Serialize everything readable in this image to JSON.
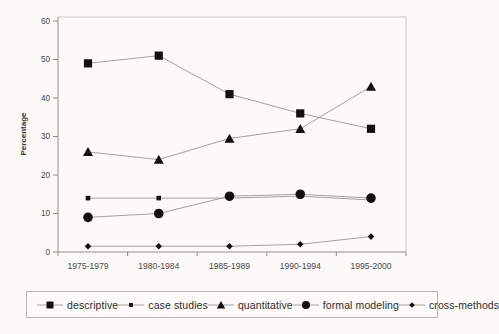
{
  "chart_data": {
    "type": "line",
    "title": "",
    "xlabel": "",
    "ylabel": "Percentage",
    "ylim": [
      0,
      60
    ],
    "yticks": [
      0,
      10,
      20,
      30,
      40,
      50,
      60
    ],
    "grid": false,
    "legend_position": "bottom",
    "categories": [
      "1975-1979",
      "1980-1984",
      "1985-1989",
      "1990-1994",
      "1995-2000"
    ],
    "series": [
      {
        "name": "descriptive",
        "marker": "square-large",
        "values": [
          49,
          51,
          41,
          36,
          32
        ]
      },
      {
        "name": "case studies",
        "marker": "square-small",
        "values": [
          14,
          14,
          14,
          14.5,
          13.5
        ]
      },
      {
        "name": "quantitative",
        "marker": "triangle",
        "values": [
          26,
          24,
          29.5,
          32,
          43
        ]
      },
      {
        "name": "formal modeling",
        "marker": "circle",
        "values": [
          9,
          10,
          14.5,
          15,
          14
        ]
      },
      {
        "name": "cross-methods",
        "marker": "diamond",
        "values": [
          1.5,
          1.5,
          1.5,
          2,
          4
        ]
      }
    ],
    "colors": {
      "marker": "#121110",
      "line": "#9a9792",
      "axis": "#918e89",
      "frame": "#c9c6c1",
      "tick_text": "#4a4845",
      "label_text": "#3a3836"
    }
  }
}
